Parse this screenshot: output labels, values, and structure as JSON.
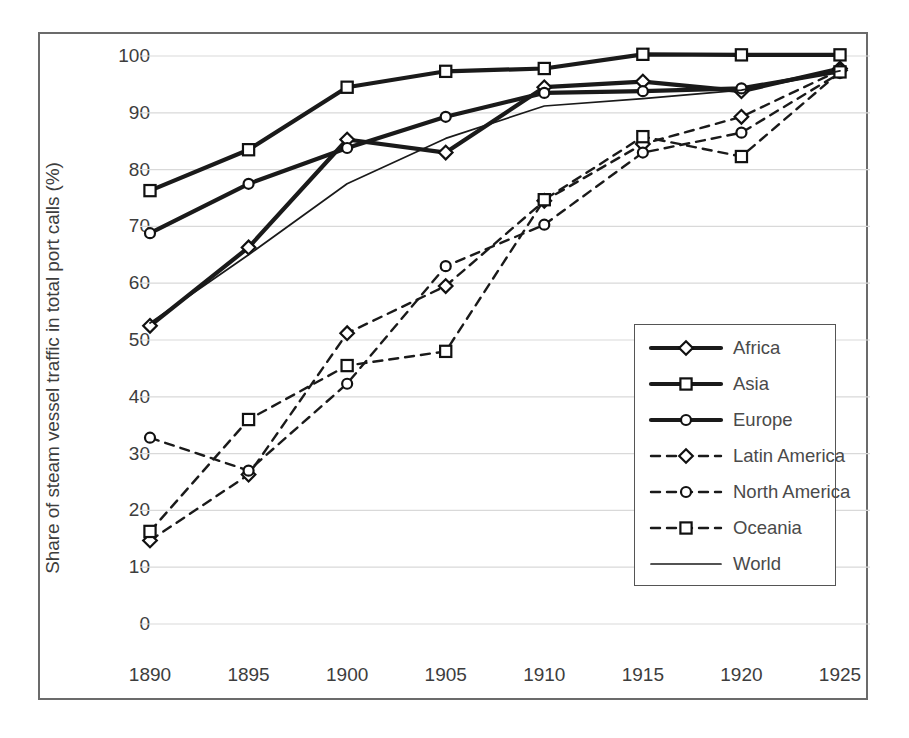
{
  "chart_data": {
    "type": "line",
    "title": "",
    "xlabel": "",
    "ylabel": "Share of steam vessel traffic in total port calls (%)",
    "x": [
      1890,
      1895,
      1900,
      1905,
      1910,
      1915,
      1920,
      1925
    ],
    "xticklabels": [
      "1890",
      "1895",
      "1900",
      "1905",
      "1910",
      "1915",
      "1920",
      "1925"
    ],
    "yticklabels": [
      "0",
      "10",
      "20",
      "30",
      "40",
      "50",
      "60",
      "70",
      "80",
      "90",
      "100"
    ],
    "ylim": [
      0,
      100
    ],
    "ytick_step": 10,
    "grid": "horizontal",
    "legend_position": "lower-right-inside",
    "series": [
      {
        "name": "Africa",
        "marker": "diamond",
        "linestyle": "solid",
        "linewidth": "thick",
        "color": "#1a1a1a",
        "values": [
          52.5,
          66.3,
          85.3,
          83.0,
          94.5,
          95.5,
          93.8,
          97.8
        ]
      },
      {
        "name": "Asia",
        "marker": "square",
        "linestyle": "solid",
        "linewidth": "thick",
        "color": "#1a1a1a",
        "values": [
          76.3,
          83.5,
          94.5,
          97.3,
          97.8,
          100.3,
          100.2,
          100.2
        ]
      },
      {
        "name": "Europe",
        "marker": "circle",
        "linestyle": "solid",
        "linewidth": "thick",
        "color": "#1a1a1a",
        "values": [
          68.8,
          77.5,
          83.8,
          89.3,
          93.5,
          93.8,
          94.3,
          97.3
        ]
      },
      {
        "name": "Latin America",
        "marker": "diamond",
        "linestyle": "dashed",
        "linewidth": "thin",
        "color": "#1a1a1a",
        "values": [
          14.7,
          26.3,
          51.2,
          59.5,
          74.5,
          84.5,
          89.3,
          97.5
        ]
      },
      {
        "name": "North America",
        "marker": "circle",
        "linestyle": "dashed",
        "linewidth": "thin",
        "color": "#1a1a1a",
        "values": [
          32.8,
          27.0,
          42.3,
          63.0,
          70.3,
          83.0,
          86.5,
          97.0
        ]
      },
      {
        "name": "Oceania",
        "marker": "square",
        "linestyle": "dashed",
        "linewidth": "thin",
        "color": "#1a1a1a",
        "values": [
          16.3,
          36.0,
          45.5,
          48.0,
          74.7,
          85.8,
          82.3,
          97.2
        ]
      },
      {
        "name": "World",
        "marker": "none",
        "linestyle": "solid",
        "linewidth": "hairline",
        "color": "#1a1a1a",
        "values": [
          53.0,
          65.0,
          77.5,
          85.5,
          91.2,
          92.5,
          94.0,
          97.4
        ]
      }
    ]
  }
}
